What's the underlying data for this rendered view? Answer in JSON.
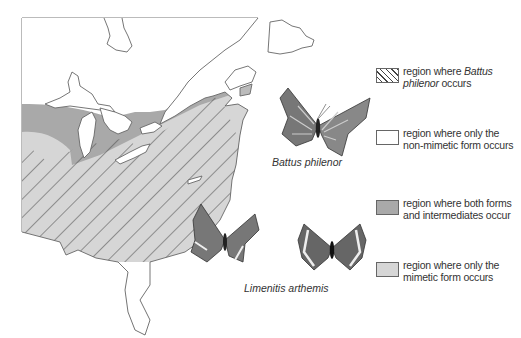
{
  "figure": {
    "type": "range map",
    "region": "eastern North America",
    "colors": {
      "background": "#ffffff",
      "outline": "#555555",
      "both_forms_fill": "#a9a9a9",
      "mimetic_only_fill": "#d6d6d6",
      "non_mimetic_fill": "#ffffff",
      "hatch_line": "#444444"
    }
  },
  "captions": {
    "battus": "Battus philenor",
    "limenitis": "Limenitis arthemis"
  },
  "legend": {
    "items": [
      {
        "swatch": "hatch",
        "line1_pre": "region where ",
        "line1_italic": "Battus",
        "line2_italic": "philenor",
        "line2_post": " occurs"
      },
      {
        "swatch": "white",
        "line1": "region where only the",
        "line2": "non-mimetic form occurs"
      },
      {
        "swatch": "dark",
        "line1": "region where both forms",
        "line2": "and intermediates occur"
      },
      {
        "swatch": "light",
        "line1": "region where only the",
        "line2": "mimetic form occurs"
      }
    ]
  },
  "icons": {
    "butterfly_battus": "butterfly-icon",
    "butterfly_limenitis_nonmimetic": "butterfly-icon",
    "butterfly_limenitis_mimetic": "butterfly-icon"
  }
}
